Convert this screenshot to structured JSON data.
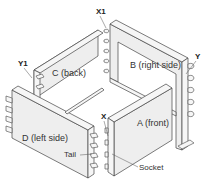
{
  "diagram": {
    "type": "isometric-exploded-assembly",
    "panels": [
      {
        "id": "C",
        "label": "C (back)"
      },
      {
        "id": "B",
        "label": "B (right side)"
      },
      {
        "id": "D",
        "label": "D (left side)"
      },
      {
        "id": "A",
        "label": "A (front)"
      }
    ],
    "callouts": [
      {
        "id": "X1",
        "label": "X1"
      },
      {
        "id": "Y1",
        "label": "Y1"
      },
      {
        "id": "Y",
        "label": "Y"
      },
      {
        "id": "X",
        "label": "X"
      }
    ],
    "parts": [
      {
        "id": "tail",
        "label": "Tail"
      },
      {
        "id": "socket",
        "label": "Socket"
      }
    ],
    "colors": {
      "panel_face": "#eeeeee",
      "outline": "#444444",
      "text": "#333333"
    }
  }
}
